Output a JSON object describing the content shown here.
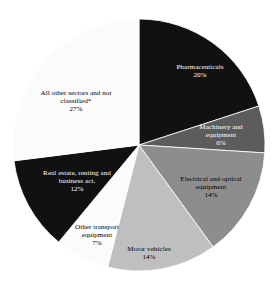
{
  "chart_data": {
    "type": "pie",
    "title": "",
    "subtitle": "",
    "xlabel": "",
    "ylabel": "",
    "legend_position": "none",
    "labels_inside_slices": true,
    "start_angle_deg": 0,
    "direction": "clockwise",
    "units": "percent",
    "categories": [
      "Pharmaceuticals",
      "Machinery and equipment",
      "Electrical and optical equipment",
      "Motor vehicles",
      "Other transport equipment",
      "Real estate, renting and business act.",
      "All other sectors and not classified*"
    ],
    "values": [
      20,
      6,
      14,
      14,
      7,
      12,
      27
    ],
    "value_labels": [
      "20%",
      "6%",
      "14%",
      "14%",
      "7%",
      "12%",
      "27%"
    ],
    "colors": [
      "#111111",
      "#5c5c5c",
      "#8d8d8d",
      "#bfbfbf",
      "#fbfbfb",
      "#111111",
      "#fbfbfb"
    ],
    "slices": [
      {
        "name": "Pharmaceuticals",
        "label_line1": "Pharmaceuticals",
        "label_line2": "",
        "value": 20,
        "value_label": "20%",
        "color": "#111111",
        "text_color": "#ffffff"
      },
      {
        "name": "Machinery and equipment",
        "label_line1": "Machinery and",
        "label_line2": "equipment",
        "value": 6,
        "value_label": "6%",
        "color": "#5c5c5c",
        "text_color": "#ffffff"
      },
      {
        "name": "Electrical and optical equipment",
        "label_line1": "Electrical and optical",
        "label_line2": "equipment",
        "value": 14,
        "value_label": "14%",
        "color": "#8d8d8d",
        "text_color": "#000000"
      },
      {
        "name": "Motor vehicles",
        "label_line1": "Motor vehicles",
        "label_line2": "",
        "value": 14,
        "value_label": "14%",
        "color": "#bfbfbf",
        "text_color": "#000000"
      },
      {
        "name": "Other transport equipment",
        "label_line1": "Other transport",
        "label_line2": "equipment",
        "value": 7,
        "value_label": "7%",
        "color": "#fbfbfb",
        "text_color": "#000000"
      },
      {
        "name": "Real estate, renting and business act.",
        "label_line1": "Real estate, renting and",
        "label_line2": "business act.",
        "value": 12,
        "value_label": "12%",
        "color": "#111111",
        "text_color": "#ffffff"
      },
      {
        "name": "All other sectors and not classified*",
        "label_line1": "All other sectors and not",
        "label_line2": "classified*",
        "value": 27,
        "value_label": "27%",
        "color": "#fbfbfb",
        "text_color": "#000000"
      }
    ]
  },
  "geometry": {
    "center_x": 139,
    "center_y": 145,
    "radius": 126
  }
}
